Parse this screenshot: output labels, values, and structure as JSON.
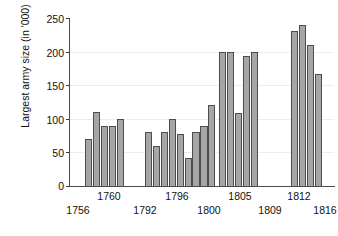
{
  "chart_data": {
    "type": "bar",
    "title": "",
    "subtitle": "",
    "xlabel": "",
    "ylabel": "Largest army size (in '000)",
    "ylim": [
      0,
      250
    ],
    "yticks": [
      0,
      50,
      100,
      150,
      200,
      250
    ],
    "grid": true,
    "legend": "none",
    "x_tick_labels_upper": [
      "1760",
      "1796",
      "1805",
      "1812"
    ],
    "x_tick_labels_lower": [
      "1756",
      "1792",
      "1800",
      "1809",
      "1816"
    ],
    "groups": [
      {
        "name": "1756-1760",
        "start_label": "1756",
        "end_label": "1760",
        "values": [
          70,
          110,
          90,
          90,
          100
        ]
      },
      {
        "name": "1792-1800",
        "start_label": "1792",
        "end_label": "1800",
        "values": [
          80,
          59,
          80,
          100,
          78,
          41,
          80,
          90,
          120
        ]
      },
      {
        "name": "1805-1809",
        "start_label": "1805",
        "end_label": "1809",
        "values": [
          200,
          200,
          108,
          194,
          200
        ]
      },
      {
        "name": "1812-1816",
        "start_label": "1812",
        "end_label": "1816",
        "values": [
          230,
          240,
          210,
          167
        ]
      }
    ],
    "values_all": [
      70,
      110,
      90,
      90,
      100,
      80,
      59,
      80,
      100,
      78,
      41,
      80,
      90,
      120,
      200,
      200,
      108,
      194,
      200,
      230,
      240,
      210,
      167
    ],
    "bar_color": "#a6a6a6",
    "bar_edge_color": "#4d4d4d",
    "axis_color": "#4a4a4a",
    "grid_color": "#ededed",
    "text_color": "#111111"
  },
  "axis": {
    "y_tick_0": "0",
    "y_tick_1": "50",
    "y_tick_2": "100",
    "y_tick_3": "150",
    "y_tick_4": "200",
    "y_tick_5": "250",
    "y_title": "Largest army size (in '000)"
  },
  "xlabels": {
    "u0": "1760",
    "u1": "1796",
    "u2": "1805",
    "u3": "1812",
    "l0": "1756",
    "l1": "1792",
    "l2": "1800",
    "l3": "1809",
    "l4": "1816"
  }
}
